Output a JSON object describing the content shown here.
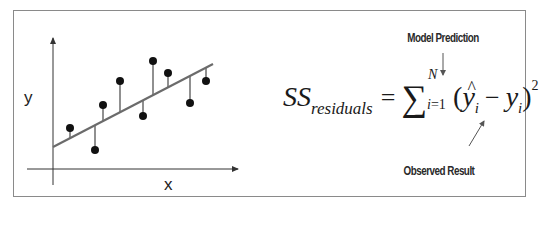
{
  "diagram": {
    "plot": {
      "x_axis_label": "x",
      "y_axis_label": "y",
      "regression_line": {
        "x1": 53,
        "y1": 147,
        "x2": 213,
        "y2": 64
      },
      "points": [
        {
          "x": 70,
          "y": 128
        },
        {
          "x": 95,
          "y": 150
        },
        {
          "x": 103,
          "y": 105
        },
        {
          "x": 120,
          "y": 81
        },
        {
          "x": 143,
          "y": 116
        },
        {
          "x": 153,
          "y": 61
        },
        {
          "x": 168,
          "y": 73
        },
        {
          "x": 190,
          "y": 103
        },
        {
          "x": 206,
          "y": 81
        }
      ]
    },
    "formula": {
      "lhs": "SS",
      "lhs_subscript": "residuals",
      "equals": "=",
      "sigma": "∑",
      "upper_limit": "N",
      "lower_limit_var": "i",
      "lower_limit_eq": "=1",
      "open_paren": "(",
      "yhat": "y",
      "hat_mark": "^",
      "index": "i",
      "minus": "−",
      "y": "y",
      "close_paren": ")",
      "exponent": "2"
    },
    "annotations": {
      "model_prediction": "Model Prediction",
      "observed_result": "Observed Result"
    },
    "colors": {
      "frame_border": "#8a8a8a",
      "line": "#6b6b6b",
      "point": "#111111",
      "axis": "#333333",
      "text": "#1a1a1a"
    }
  }
}
